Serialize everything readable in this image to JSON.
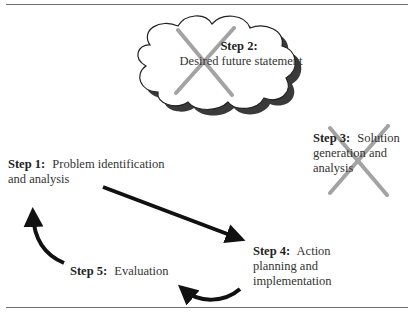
{
  "diagram": {
    "type": "process-cycle",
    "steps": [
      {
        "id": 1,
        "prefix": "Step 1:",
        "text": "Problem identification and analysis",
        "line1": "Problem identification",
        "line2": "and analysis",
        "crossed_out": false
      },
      {
        "id": 2,
        "prefix": "Step 2:",
        "text": "Desired future statement",
        "shape": "cloud",
        "crossed_out": true
      },
      {
        "id": 3,
        "prefix": "Step 3:",
        "text": "Solution generation and analysis",
        "line1": "Solution",
        "line2": "generation and",
        "line3": "analysis",
        "crossed_out": true
      },
      {
        "id": 4,
        "prefix": "Step 4:",
        "text": "Action planning and implementation",
        "line1": "Action",
        "line2": "planning and",
        "line3": "implementation",
        "crossed_out": false
      },
      {
        "id": 5,
        "prefix": "Step 5:",
        "text": "Evaluation",
        "crossed_out": false
      }
    ],
    "arrows": [
      {
        "from": 1,
        "to": 4,
        "style": "straight"
      },
      {
        "from": 4,
        "to": 5,
        "style": "curved"
      },
      {
        "from": 5,
        "to": 1,
        "style": "curved"
      }
    ],
    "colors": {
      "arrow": "#111111",
      "cross_out": "#9a9a9a",
      "cloud_outline": "#222222",
      "cloud_shadow": "#3a3a3a",
      "rule": "#6e6e6e"
    }
  }
}
